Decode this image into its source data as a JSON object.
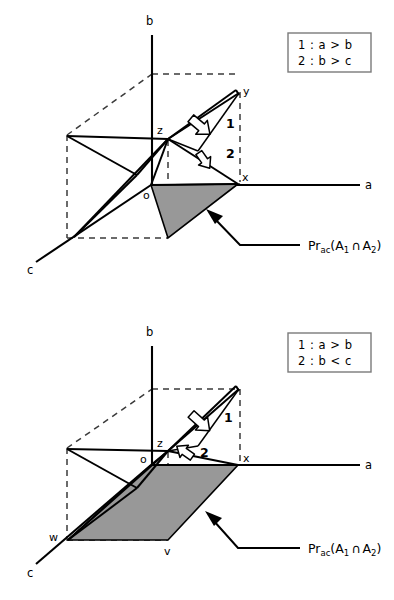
{
  "figure": {
    "panels": [
      {
        "id": "panel-top",
        "legend": {
          "lines": [
            {
              "key": "1",
              "separator": ":",
              "relation": "a > b"
            },
            {
              "key": "2",
              "separator": ":",
              "relation": "b > c"
            }
          ]
        },
        "axes": [
          {
            "name": "b",
            "label": "b"
          },
          {
            "name": "a",
            "label": "a"
          },
          {
            "name": "c",
            "label": "c"
          }
        ],
        "vertices": [
          {
            "name": "y",
            "label": "y"
          },
          {
            "name": "z",
            "label": "z"
          },
          {
            "name": "x",
            "label": "x"
          },
          {
            "name": "o",
            "label": "o"
          }
        ],
        "markers": [
          {
            "name": "marker-1",
            "label": "1"
          },
          {
            "name": "marker-2",
            "label": "2"
          }
        ],
        "annotation": {
          "prefix": "Pr",
          "subscript": "ac",
          "open": "(",
          "set1": "A",
          "set1_sub": "1",
          "operator": "∩",
          "set2": "A",
          "set2_sub": "2",
          "close": ")"
        }
      },
      {
        "id": "panel-bottom",
        "legend": {
          "lines": [
            {
              "key": "1",
              "separator": ":",
              "relation": "a > b"
            },
            {
              "key": "2",
              "separator": ":",
              "relation": "b < c"
            }
          ]
        },
        "axes": [
          {
            "name": "b",
            "label": "b"
          },
          {
            "name": "a",
            "label": "a"
          },
          {
            "name": "c",
            "label": "c"
          }
        ],
        "vertices": [
          {
            "name": "z",
            "label": "z"
          },
          {
            "name": "x",
            "label": "x"
          },
          {
            "name": "o",
            "label": "o"
          },
          {
            "name": "w",
            "label": "w"
          },
          {
            "name": "v",
            "label": "v"
          }
        ],
        "markers": [
          {
            "name": "marker-1",
            "label": "1"
          },
          {
            "name": "marker-2",
            "label": "2"
          }
        ],
        "annotation": {
          "prefix": "Pr",
          "subscript": "ac",
          "open": "(",
          "set1": "A",
          "set1_sub": "1",
          "operator": "∩",
          "set2": "A",
          "set2_sub": "2",
          "close": ")"
        }
      }
    ],
    "colors": {
      "shade_fill": "#989898",
      "line": "#000000",
      "dashed": "#3b3b3b",
      "legend_border": "#7a7a7a",
      "background": "#ffffff"
    }
  }
}
